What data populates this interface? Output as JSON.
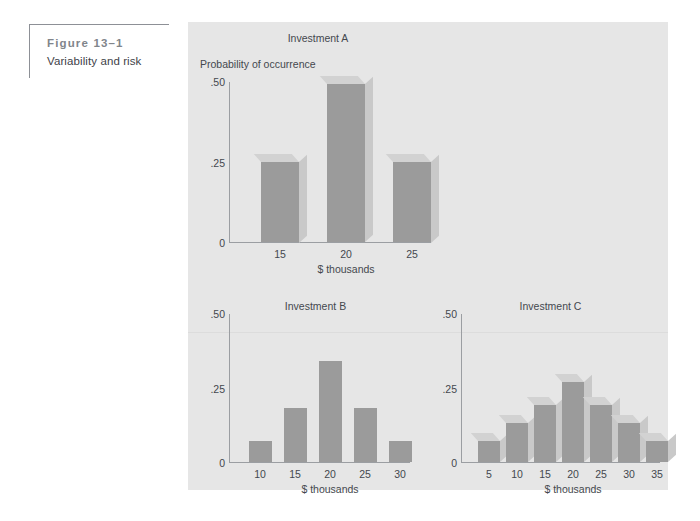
{
  "caption": {
    "figure_number": "Figure 13–1",
    "figure_title": "Variability and risk"
  },
  "colors": {
    "plate_background": "#e6e6e6",
    "bar_front": "#9b9b9b",
    "bar_side": "#c9c9c9",
    "bar_top": "#d2d2d2",
    "axis": "#9b9ea2",
    "text": "#44484e",
    "caption_rule": "#8d9096",
    "figure_number_text": "#81858b"
  },
  "chart_data": [
    {
      "type": "bar",
      "title": "Investment A",
      "ylabel": "Probability of occurrence",
      "xlabel": "$ thousands",
      "categories": [
        "15",
        "20",
        "25"
      ],
      "values": [
        0.25,
        0.49,
        0.25
      ],
      "ytick_labels": [
        ".50",
        ".25",
        "0"
      ],
      "ytick_values": [
        0.5,
        0.25,
        0
      ],
      "ylim": [
        0,
        0.5
      ],
      "grid": false,
      "legend": "none",
      "style": "3d"
    },
    {
      "type": "bar",
      "title": "Investment B",
      "ylabel": "",
      "xlabel": "$ thousands",
      "categories": [
        "10",
        "15",
        "20",
        "25",
        "30"
      ],
      "values": [
        0.07,
        0.18,
        0.34,
        0.18,
        0.07
      ],
      "ytick_labels": [
        ".50",
        ".25",
        "0"
      ],
      "ytick_values": [
        0.5,
        0.25,
        0
      ],
      "ylim": [
        0,
        0.5
      ],
      "grid": false,
      "legend": "none",
      "style": "flat"
    },
    {
      "type": "bar",
      "title": "Investment C",
      "ylabel": "",
      "xlabel": "$ thousands",
      "categories": [
        "5",
        "10",
        "15",
        "20",
        "25",
        "30",
        "35"
      ],
      "values": [
        0.07,
        0.13,
        0.19,
        0.27,
        0.19,
        0.13,
        0.07
      ],
      "ytick_labels": [
        ".50",
        ".25",
        "0"
      ],
      "ytick_values": [
        0.5,
        0.25,
        0
      ],
      "ylim": [
        0,
        0.5
      ],
      "grid": false,
      "legend": "none",
      "style": "3d"
    }
  ]
}
